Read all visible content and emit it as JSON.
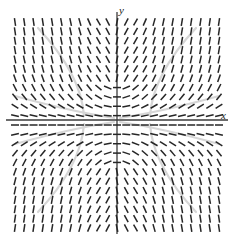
{
  "figure": {
    "type": "slope-field",
    "title": "",
    "axis_labels": {
      "x": "x",
      "y": "y"
    },
    "origin": {
      "x": 117,
      "y": 120
    },
    "plot_extent": {
      "x_min": 15,
      "x_max": 219,
      "y_min": 22,
      "y_max": 228
    },
    "axis_color": "#3b3b3b",
    "dash_color": "#262626",
    "curve_color": "#d6d6d6",
    "background": "#ffffff"
  },
  "chart_data": {
    "type": "scatter",
    "title": "",
    "xlabel": "x",
    "ylabel": "y",
    "grid": false,
    "legend": null,
    "xlim": [
      -11,
      11
    ],
    "ylim": [
      -11,
      11
    ],
    "grid_columns": 23,
    "grid_rows": 23,
    "dash_length": 8,
    "dash_thickness": 1.5,
    "slope_model": "angle = 80 * tanh(0.38*u) * tanh(0.30*v) + 0.0, with u = x index offset, v = y index offset, mirrored in both axes",
    "annotations": []
  }
}
